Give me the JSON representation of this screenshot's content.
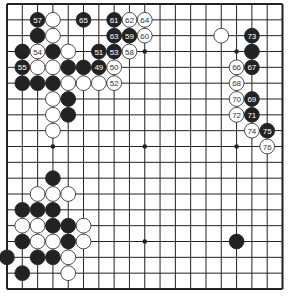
{
  "game": {
    "type": "go",
    "board_size": 19,
    "colors": {
      "board": "#ffffff",
      "line": "#222222",
      "black": "#222222",
      "white": "#ffffff",
      "black_label": "#ffffff",
      "white_label": "#333333"
    },
    "star_points": [
      [
        3,
        3
      ],
      [
        9,
        3
      ],
      [
        15,
        3
      ],
      [
        3,
        9
      ],
      [
        9,
        9
      ],
      [
        15,
        9
      ],
      [
        3,
        15
      ],
      [
        9,
        15
      ],
      [
        15,
        15
      ]
    ],
    "stones": [
      {
        "c": 2,
        "r": 1,
        "color": "black",
        "label": "57"
      },
      {
        "c": 3,
        "r": 1,
        "color": "white",
        "label": ""
      },
      {
        "c": 5,
        "r": 1,
        "color": "black",
        "label": "65"
      },
      {
        "c": 7,
        "r": 1,
        "color": "black",
        "label": "61"
      },
      {
        "c": 8,
        "r": 1,
        "color": "white",
        "label": "62"
      },
      {
        "c": 9,
        "r": 1,
        "color": "white",
        "label": "64"
      },
      {
        "c": 2,
        "r": 2,
        "color": "black",
        "label": ""
      },
      {
        "c": 3,
        "r": 2,
        "color": "white",
        "label": ""
      },
      {
        "c": 7,
        "r": 2,
        "color": "black",
        "label": "63"
      },
      {
        "c": 8,
        "r": 2,
        "color": "black",
        "label": "59"
      },
      {
        "c": 9,
        "r": 2,
        "color": "white",
        "label": "60"
      },
      {
        "c": 14,
        "r": 2,
        "color": "white",
        "label": ""
      },
      {
        "c": 16,
        "r": 2,
        "color": "black",
        "label": "73"
      },
      {
        "c": 1,
        "r": 3,
        "color": "black",
        "label": ""
      },
      {
        "c": 2,
        "r": 3,
        "color": "white",
        "label": "54"
      },
      {
        "c": 3,
        "r": 3,
        "color": "black",
        "label": ""
      },
      {
        "c": 4,
        "r": 3,
        "color": "white",
        "label": ""
      },
      {
        "c": 6,
        "r": 3,
        "color": "black",
        "label": "51"
      },
      {
        "c": 7,
        "r": 3,
        "color": "black",
        "label": "53"
      },
      {
        "c": 8,
        "r": 3,
        "color": "white",
        "label": "58"
      },
      {
        "c": 16,
        "r": 3,
        "color": "black",
        "label": ""
      },
      {
        "c": 1,
        "r": 4,
        "color": "black",
        "label": "55"
      },
      {
        "c": 2,
        "r": 4,
        "color": "white",
        "label": ""
      },
      {
        "c": 3,
        "r": 4,
        "color": "white",
        "label": ""
      },
      {
        "c": 4,
        "r": 4,
        "color": "black",
        "label": ""
      },
      {
        "c": 5,
        "r": 4,
        "color": "black",
        "label": ""
      },
      {
        "c": 6,
        "r": 4,
        "color": "black",
        "label": "49"
      },
      {
        "c": 7,
        "r": 4,
        "color": "white",
        "label": "50"
      },
      {
        "c": 15,
        "r": 4,
        "color": "white",
        "label": "66"
      },
      {
        "c": 16,
        "r": 4,
        "color": "black",
        "label": "67"
      },
      {
        "c": 1,
        "r": 5,
        "color": "black",
        "label": ""
      },
      {
        "c": 2,
        "r": 5,
        "color": "black",
        "label": ""
      },
      {
        "c": 3,
        "r": 5,
        "color": "black",
        "label": ""
      },
      {
        "c": 4,
        "r": 5,
        "color": "white",
        "label": ""
      },
      {
        "c": 5,
        "r": 5,
        "color": "white",
        "label": ""
      },
      {
        "c": 6,
        "r": 5,
        "color": "white",
        "label": ""
      },
      {
        "c": 7,
        "r": 5,
        "color": "white",
        "label": "52"
      },
      {
        "c": 15,
        "r": 5,
        "color": "white",
        "label": "68"
      },
      {
        "c": 3,
        "r": 6,
        "color": "white",
        "label": ""
      },
      {
        "c": 4,
        "r": 6,
        "color": "black",
        "label": ""
      },
      {
        "c": 15,
        "r": 6,
        "color": "white",
        "label": "70"
      },
      {
        "c": 16,
        "r": 6,
        "color": "black",
        "label": "69"
      },
      {
        "c": 3,
        "r": 7,
        "color": "white",
        "label": ""
      },
      {
        "c": 4,
        "r": 7,
        "color": "black",
        "label": ""
      },
      {
        "c": 15,
        "r": 7,
        "color": "white",
        "label": "72"
      },
      {
        "c": 16,
        "r": 7,
        "color": "black",
        "label": "71"
      },
      {
        "c": 3,
        "r": 8,
        "color": "white",
        "label": ""
      },
      {
        "c": 16,
        "r": 8,
        "color": "white",
        "label": "74"
      },
      {
        "c": 17,
        "r": 8,
        "color": "black",
        "label": "75"
      },
      {
        "c": 17,
        "r": 9,
        "color": "white",
        "label": "76"
      },
      {
        "c": 3,
        "r": 11,
        "color": "black",
        "label": ""
      },
      {
        "c": 2,
        "r": 12,
        "color": "white",
        "label": ""
      },
      {
        "c": 3,
        "r": 12,
        "color": "white",
        "label": ""
      },
      {
        "c": 4,
        "r": 12,
        "color": "white",
        "label": ""
      },
      {
        "c": 1,
        "r": 13,
        "color": "black",
        "label": ""
      },
      {
        "c": 2,
        "r": 13,
        "color": "black",
        "label": ""
      },
      {
        "c": 3,
        "r": 13,
        "color": "black",
        "label": ""
      },
      {
        "c": 1,
        "r": 14,
        "color": "white",
        "label": ""
      },
      {
        "c": 2,
        "r": 14,
        "color": "white",
        "label": ""
      },
      {
        "c": 3,
        "r": 14,
        "color": "black",
        "label": ""
      },
      {
        "c": 4,
        "r": 14,
        "color": "black",
        "label": ""
      },
      {
        "c": 5,
        "r": 14,
        "color": "white",
        "label": ""
      },
      {
        "c": 1,
        "r": 15,
        "color": "black",
        "label": ""
      },
      {
        "c": 2,
        "r": 15,
        "color": "white",
        "label": ""
      },
      {
        "c": 3,
        "r": 15,
        "color": "white",
        "label": ""
      },
      {
        "c": 4,
        "r": 15,
        "color": "black",
        "label": ""
      },
      {
        "c": 5,
        "r": 15,
        "color": "white",
        "label": ""
      },
      {
        "c": 15,
        "r": 15,
        "color": "black",
        "label": ""
      },
      {
        "c": 0,
        "r": 16,
        "color": "black",
        "label": ""
      },
      {
        "c": 2,
        "r": 16,
        "color": "black",
        "label": ""
      },
      {
        "c": 3,
        "r": 16,
        "color": "black",
        "label": ""
      },
      {
        "c": 4,
        "r": 16,
        "color": "white",
        "label": ""
      },
      {
        "c": 1,
        "r": 17,
        "color": "black",
        "label": ""
      },
      {
        "c": 4,
        "r": 17,
        "color": "white",
        "label": ""
      }
    ]
  }
}
